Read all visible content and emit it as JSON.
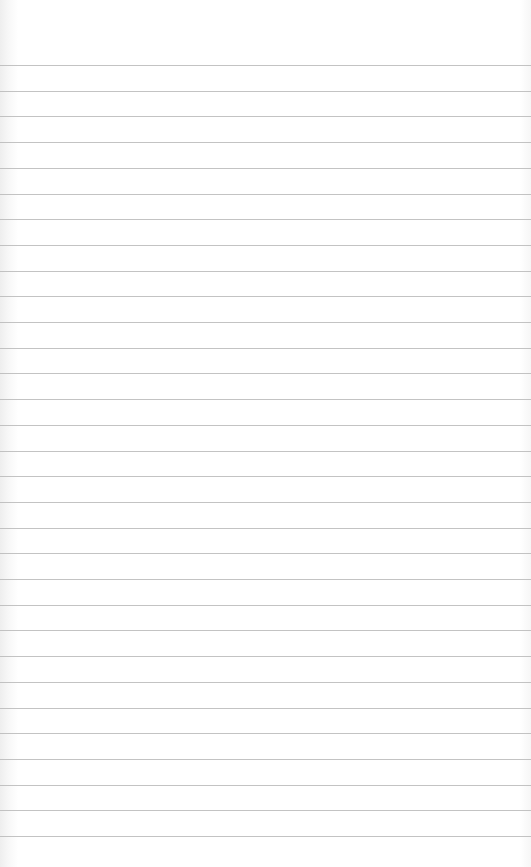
{
  "paper": {
    "type": "lined notebook paper",
    "background_color": "#ffffff",
    "rule_color": "#b8b8b8",
    "first_rule_y": 65,
    "rule_spacing": 25.7,
    "rule_count": 31
  }
}
